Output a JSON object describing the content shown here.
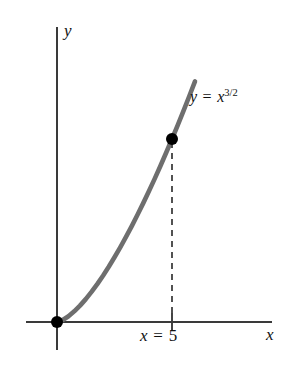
{
  "figure": {
    "background_color": "#ffffff",
    "axis_color": "#3a3a3a",
    "curve_color": "#6e6e6e",
    "point_color": "#000000",
    "dash_color": "#4a4a4a"
  },
  "labels": {
    "y_axis": "y",
    "x_axis": "x",
    "x_value_prefix": "x",
    "x_value_equals": " = ",
    "x_value_number": "5",
    "curve_var": "y",
    "curve_equals": " = ",
    "curve_base": "x",
    "curve_exponent": "3/2"
  },
  "chart_data": {
    "type": "line",
    "title": "",
    "subtitle": "",
    "xlabel": "x",
    "ylabel": "y",
    "annotations": [
      {
        "text": "y = x^3/2",
        "kind": "curve-label"
      },
      {
        "text": "x = 5",
        "kind": "axis-tick-label"
      }
    ],
    "legend": [],
    "legend_position": "none",
    "grid": false,
    "xlim": [
      -0.85,
      7.0
    ],
    "ylim": [
      -0.7,
      14.8
    ],
    "series": [
      {
        "name": "y = x^3/2",
        "function": "y = x^(3/2)",
        "x": [
          0,
          0.25,
          0.5,
          0.75,
          1,
          1.25,
          1.5,
          1.75,
          2,
          2.25,
          2.5,
          2.75,
          3,
          3.25,
          3.5,
          3.75,
          4,
          4.25,
          4.5,
          4.75,
          5,
          5.25,
          5.5,
          5.75,
          6
        ],
        "values": [
          0,
          0.125,
          0.354,
          0.65,
          1,
          1.398,
          1.837,
          2.315,
          2.828,
          3.375,
          3.953,
          4.56,
          5.196,
          5.86,
          6.548,
          7.262,
          8,
          8.761,
          9.546,
          10.354,
          11.18,
          12.03,
          12.9,
          13.79,
          14.7
        ]
      }
    ],
    "points": [
      {
        "label": "origin",
        "x": 0,
        "y": 0,
        "marker": "filled-circle"
      },
      {
        "label": "x = 5",
        "x": 5,
        "y": 11.18,
        "marker": "filled-circle"
      }
    ],
    "dropline": {
      "from_x": 5,
      "from_y": 11.18,
      "to_y": 0,
      "style": "dashed"
    },
    "ticks": {
      "x": [
        5
      ],
      "x_tick_labels": [
        "x = 5"
      ],
      "y": []
    }
  }
}
